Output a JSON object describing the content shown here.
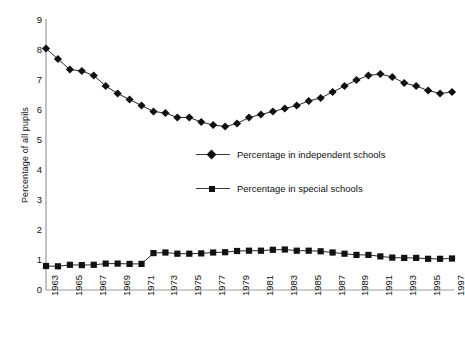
{
  "chart_data": {
    "type": "line",
    "title": "",
    "xlabel": "",
    "ylabel": "Percentage of all pupils",
    "ylim": [
      0,
      9
    ],
    "ytick_step": 1,
    "yticks": [
      9,
      8,
      7,
      6,
      5,
      4,
      3,
      2,
      1,
      0
    ],
    "xlim": [
      1963,
      1997
    ],
    "grid": false,
    "legend_position": "center",
    "x": [
      1963,
      1964,
      1965,
      1966,
      1967,
      1968,
      1969,
      1970,
      1971,
      1972,
      1973,
      1974,
      1975,
      1976,
      1977,
      1978,
      1979,
      1980,
      1981,
      1982,
      1983,
      1984,
      1985,
      1986,
      1987,
      1988,
      1989,
      1990,
      1991,
      1992,
      1993,
      1994,
      1995,
      1996,
      1997
    ],
    "xtick_labels": [
      "1963",
      "1965",
      "1967",
      "1969",
      "1971",
      "1973",
      "1975",
      "1977",
      "1979",
      "1981",
      "1983",
      "1985",
      "1987",
      "1989",
      "1991",
      "1993",
      "1995",
      "1997"
    ],
    "series": [
      {
        "name": "Percentage in independent schools",
        "marker": "diamond",
        "color": "#111111",
        "values": [
          8.05,
          7.7,
          7.35,
          7.3,
          7.15,
          6.8,
          6.55,
          6.35,
          6.15,
          5.95,
          5.9,
          5.75,
          5.75,
          5.6,
          5.5,
          5.45,
          5.55,
          5.75,
          5.85,
          5.95,
          6.05,
          6.15,
          6.3,
          6.4,
          6.6,
          6.8,
          7.0,
          7.15,
          7.2,
          7.1,
          6.9,
          6.8,
          6.65,
          6.55,
          6.6
        ]
      },
      {
        "name": "Percentage in special schools",
        "marker": "square",
        "color": "#111111",
        "values": [
          0.8,
          0.79,
          0.84,
          0.83,
          0.84,
          0.88,
          0.88,
          0.87,
          0.87,
          1.23,
          1.25,
          1.21,
          1.21,
          1.22,
          1.25,
          1.26,
          1.3,
          1.31,
          1.31,
          1.34,
          1.35,
          1.31,
          1.31,
          1.29,
          1.25,
          1.21,
          1.17,
          1.17,
          1.12,
          1.08,
          1.07,
          1.07,
          1.04,
          1.04,
          1.05
        ]
      }
    ]
  },
  "legend": {
    "items": [
      {
        "label": "Percentage in independent schools",
        "marker": "diamond"
      },
      {
        "label": "Percentage in special schools",
        "marker": "square"
      }
    ]
  },
  "axes": {
    "y_title": "Percentage of all pupils"
  }
}
